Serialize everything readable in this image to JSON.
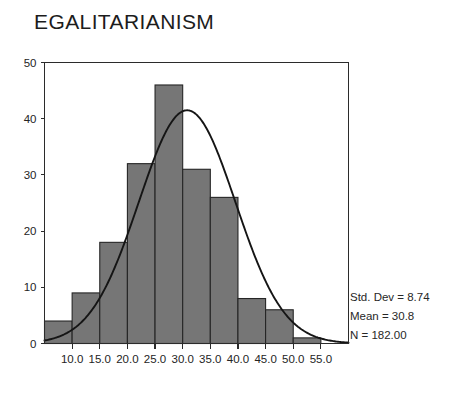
{
  "chart_data": {
    "type": "bar",
    "title": "EGALITARIANISM",
    "xlabel": "",
    "ylabel": "",
    "categories": [
      "7.5",
      "10.0",
      "15.0",
      "20.0",
      "25.0",
      "30.0",
      "35.0",
      "40.0",
      "45.0",
      "50.0",
      "55.0"
    ],
    "values": [
      4,
      9,
      18,
      32,
      46,
      31,
      26,
      8,
      6,
      1,
      1
    ],
    "bin_width": 5,
    "bin_edges": [
      5.0,
      10.0,
      15.0,
      20.0,
      25.0,
      30.0,
      35.0,
      40.0,
      45.0,
      50.0,
      55.0,
      60.0
    ],
    "bar_heights": [
      4,
      9,
      18,
      32,
      46,
      31,
      26,
      8,
      6,
      1
    ],
    "xlim": [
      5.0,
      60.0
    ],
    "ylim": [
      0,
      50
    ],
    "xticks": [
      "10.0",
      "15.0",
      "20.0",
      "25.0",
      "30.0",
      "35.0",
      "40.0",
      "45.0",
      "50.0",
      "55.0"
    ],
    "xtick_values": [
      10,
      15,
      20,
      25,
      30,
      35,
      40,
      45,
      50,
      55
    ],
    "yticks": [
      "0",
      "10",
      "20",
      "30",
      "40",
      "50"
    ],
    "ytick_values": [
      0,
      10,
      20,
      30,
      40,
      50
    ],
    "grid": false,
    "legend": false,
    "overlay": {
      "type": "normal-curve",
      "mean": 30.8,
      "std_dev": 8.74,
      "n": 182,
      "peak_value": 41.5
    },
    "bar_color": "#767676",
    "bar_edge_color": "#262626",
    "curve_color": "#151515",
    "background_color": "#ffffff"
  },
  "stats": {
    "std_dev_label": "Std. Dev = 8.74",
    "mean_label": "Mean = 30.8",
    "n_label": "N = 182.00"
  }
}
